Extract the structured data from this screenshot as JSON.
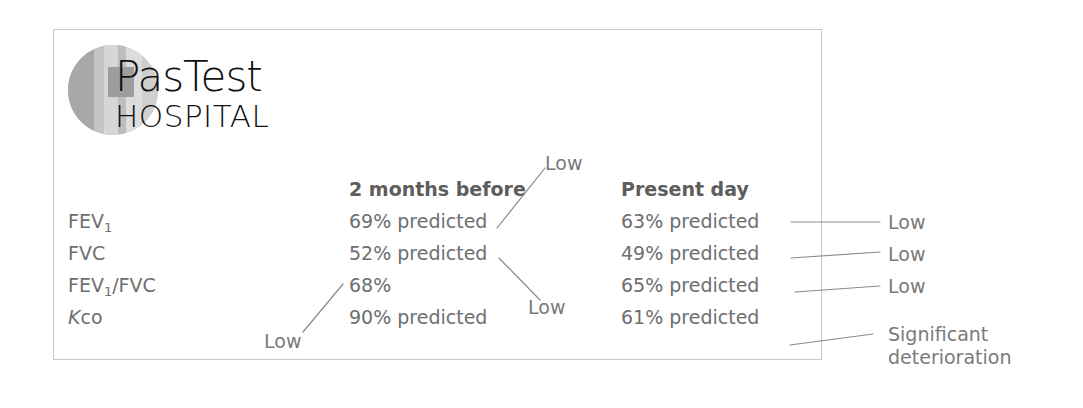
{
  "logo": {
    "name_primary": "PasTest",
    "name_secondary": "HOSPITAL"
  },
  "table": {
    "columns": [
      {
        "header": "2 months before"
      },
      {
        "header": "Present day"
      }
    ],
    "rows": [
      {
        "label_main": "FEV",
        "label_sub": "1",
        "label_tail": "",
        "before": "69% predicted",
        "present": "63% predicted"
      },
      {
        "label_main": "FVC",
        "label_sub": "",
        "label_tail": "",
        "before": "52% predicted",
        "present": "49% predicted"
      },
      {
        "label_main": "FEV",
        "label_sub": "1",
        "label_tail": "/FVC",
        "before": "68%",
        "present": "65% predicted"
      },
      {
        "label_main": "K",
        "label_sub": "",
        "label_tail": "co",
        "before": "90% predicted",
        "present": "61% predicted"
      }
    ]
  },
  "annotations": {
    "before_fev1": "Low",
    "before_fvc": "Low",
    "before_ratio": "Low",
    "present_fev1": "Low",
    "present_fvc": "Low",
    "present_ratio": "Low",
    "present_kco_line1": "Significant",
    "present_kco_line2": "deterioration"
  },
  "colors": {
    "text": "#6e6e6e",
    "heading": "#5d5d5d",
    "annotation": "#7a7a7a",
    "border": "#c9c9c9",
    "leader_line": "#8a8a8a"
  }
}
